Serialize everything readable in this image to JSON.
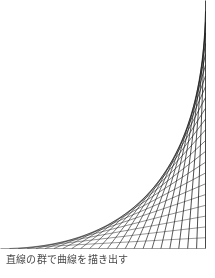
{
  "figure": {
    "title": "",
    "caption": "直線の群で曲線を描き出す",
    "background_color": "#ffffff",
    "line_color": "#1a1a1a",
    "caption_color": "#4a4a4a",
    "width": 215,
    "height": 278
  },
  "chart_data": {
    "type": "line",
    "title": "直線の群で曲線を描き出す",
    "subtitle": "",
    "xlabel": "",
    "ylabel": "",
    "grid": false,
    "legend": null,
    "xlim": [
      0,
      215
    ],
    "ylim": [
      0,
      248
    ],
    "envelope_curve": "parabola",
    "num_lines": 24,
    "axis_origin_x": 205,
    "axis_origin_y": 248,
    "vertical_axis_top_y": 0,
    "horizontal_axis_left_x": 0,
    "series": [
      {
        "name": "line-family",
        "endpoints_vertical_axis_y": [
          0.0,
          10.78,
          21.57,
          32.35,
          43.13,
          53.91,
          64.7,
          75.48,
          86.26,
          97.04,
          107.83,
          118.61,
          129.39,
          140.17,
          150.96,
          161.74,
          172.52,
          183.3,
          194.09,
          204.87,
          215.65,
          226.43,
          237.22,
          248.0
        ],
        "endpoints_horizontal_axis_x": [
          205.0,
          196.09,
          187.17,
          178.26,
          169.35,
          160.43,
          151.52,
          142.61,
          133.7,
          124.78,
          115.87,
          106.96,
          98.04,
          89.13,
          80.22,
          71.3,
          62.39,
          53.48,
          44.57,
          35.65,
          26.74,
          17.83,
          8.91,
          0.0
        ]
      }
    ]
  }
}
